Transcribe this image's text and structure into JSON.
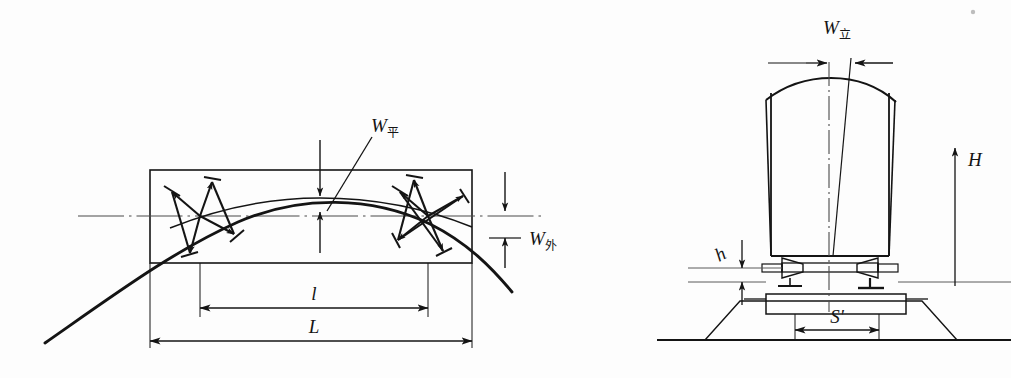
{
  "figure": {
    "background_color": "#fdfdfd",
    "ink_color": "#141414",
    "line_color_thin": "#2b2b2b",
    "centerline_color": "#5b5b5b"
  },
  "left_diagram": {
    "name": "plan-view-curve-offset",
    "labels": {
      "w_ping_base": "W",
      "w_ping_sub": "平",
      "w_wai_base": "W",
      "w_wai_sub": "外",
      "chord_short": "l",
      "chord_long": "L"
    },
    "elements": {
      "rectangle": "measurement-frame",
      "curve": "track-curve",
      "centerline": "horizontal-centerline",
      "markers": [
        "survey-star-marker-left",
        "survey-star-marker-right"
      ],
      "dimension_lines": [
        "dimension-l-short",
        "dimension-L-long"
      ],
      "offset_arrows": [
        "w-ping-offset-arrows",
        "w-wai-offset-arrows"
      ]
    }
  },
  "right_diagram": {
    "name": "cross-section-vehicle-on-track",
    "labels": {
      "w_li_base": "W",
      "w_li_sub": "立",
      "height_H": "H",
      "height_h": "h",
      "gauge_S": "S'"
    },
    "elements": {
      "car_body": "vehicle-body-outline",
      "roof": "arched-roof",
      "centerline_vertical": "vertical-centerline",
      "tilt_line": "tilted-body-axis",
      "bogie": "bogie-suspension-assembly",
      "springs": [
        "cone-spring-left",
        "cone-spring-right"
      ],
      "sleeper": "sleeper-platform",
      "ballast": "ballast-bed-trapezoid",
      "ground": "ground-line",
      "dimension_arrows": [
        "w-li-top-arrows",
        "H-vertical-arrow",
        "h-vertical-arrow",
        "S-gauge-arrows"
      ]
    }
  }
}
